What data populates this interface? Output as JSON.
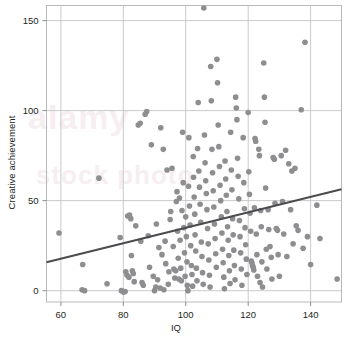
{
  "chart_data": {
    "type": "scatter",
    "title": "",
    "xlabel": "IQ",
    "ylabel": "Creative achievement",
    "xlim": [
      55.4,
      149.9
    ],
    "ylim": [
      -6.3,
      158.4
    ],
    "xticks": [
      60,
      80,
      100,
      120,
      140
    ],
    "yticks": [
      0,
      50,
      100,
      150
    ],
    "grid": true,
    "legend": null,
    "marker": {
      "shape": "circle",
      "color": "#8e8e91",
      "size": 5.6
    },
    "trendline": {
      "type": "linear",
      "color": "#4c4c4f",
      "width": 2.2,
      "x": [
        55.4,
        149.9
      ],
      "y": [
        15.8,
        56.3
      ]
    },
    "points": [
      [
        59.4,
        32.0
      ],
      [
        66.8,
        0.5
      ],
      [
        67.6,
        0.0
      ],
      [
        67.0,
        14.5
      ],
      [
        72.2,
        62.5
      ],
      [
        74.8,
        3.8
      ],
      [
        79.0,
        29.5
      ],
      [
        79.4,
        0.0
      ],
      [
        80.1,
        -0.8
      ],
      [
        80.6,
        -0.5
      ],
      [
        80.8,
        10.5
      ],
      [
        81.2,
        8.5
      ],
      [
        81.4,
        41.5
      ],
      [
        81.8,
        7.5
      ],
      [
        82.0,
        42.0
      ],
      [
        82.4,
        40.0
      ],
      [
        82.6,
        19.5
      ],
      [
        82.9,
        11.0
      ],
      [
        83.2,
        9.5
      ],
      [
        83.5,
        5.0
      ],
      [
        84.0,
        36.0
      ],
      [
        84.8,
        92.0
      ],
      [
        85.4,
        93.0
      ],
      [
        85.6,
        27.5
      ],
      [
        86.0,
        4.5
      ],
      [
        86.4,
        3.0
      ],
      [
        87.0,
        98.0
      ],
      [
        87.5,
        99.5
      ],
      [
        88.0,
        30.5
      ],
      [
        88.4,
        13.0
      ],
      [
        89.0,
        81.0
      ],
      [
        89.6,
        8.0
      ],
      [
        90.0,
        0.0
      ],
      [
        90.4,
        2.0
      ],
      [
        90.6,
        37.0
      ],
      [
        91.0,
        6.0
      ],
      [
        91.4,
        24.0
      ],
      [
        91.8,
        1.5
      ],
      [
        92.0,
        90.5
      ],
      [
        92.4,
        20.0
      ],
      [
        92.8,
        78.5
      ],
      [
        93.0,
        0.5
      ],
      [
        93.4,
        27.5
      ],
      [
        93.6,
        15.0
      ],
      [
        94.0,
        67.0
      ],
      [
        94.4,
        3.5
      ],
      [
        94.6,
        10.5
      ],
      [
        95.0,
        39.5
      ],
      [
        95.2,
        44.0
      ],
      [
        95.6,
        68.0
      ],
      [
        96.0,
        24.5
      ],
      [
        96.2,
        12.0
      ],
      [
        96.5,
        7.0
      ],
      [
        96.8,
        11.0
      ],
      [
        97.0,
        49.5
      ],
      [
        97.2,
        55.0
      ],
      [
        97.4,
        33.0
      ],
      [
        97.6,
        18.0
      ],
      [
        97.8,
        6.5
      ],
      [
        98.0,
        51.5
      ],
      [
        98.2,
        28.0
      ],
      [
        98.4,
        12.5
      ],
      [
        98.6,
        5.5
      ],
      [
        98.8,
        44.5
      ],
      [
        99.0,
        88.0
      ],
      [
        99.2,
        60.0
      ],
      [
        99.4,
        35.0
      ],
      [
        99.6,
        21.0
      ],
      [
        99.8,
        8.0
      ],
      [
        100.0,
        41.0
      ],
      [
        100.2,
        30.0
      ],
      [
        100.4,
        16.0
      ],
      [
        100.5,
        3.0
      ],
      [
        100.7,
        0.0
      ],
      [
        100.9,
        58.0
      ],
      [
        101.0,
        85.0
      ],
      [
        101.2,
        47.0
      ],
      [
        101.4,
        36.5
      ],
      [
        101.6,
        25.0
      ],
      [
        101.8,
        14.0
      ],
      [
        102.0,
        9.0
      ],
      [
        102.2,
        2.5
      ],
      [
        102.4,
        74.5
      ],
      [
        102.5,
        63.0
      ],
      [
        102.7,
        52.0
      ],
      [
        102.9,
        42.5
      ],
      [
        103.0,
        31.0
      ],
      [
        103.2,
        22.0
      ],
      [
        103.4,
        12.5
      ],
      [
        103.6,
        5.5
      ],
      [
        103.8,
        79.0
      ],
      [
        104.0,
        104.5
      ],
      [
        104.2,
        66.5
      ],
      [
        104.4,
        57.5
      ],
      [
        104.6,
        48.0
      ],
      [
        104.8,
        38.0
      ],
      [
        105.0,
        27.0
      ],
      [
        105.2,
        19.0
      ],
      [
        105.4,
        10.0
      ],
      [
        105.6,
        3.5
      ],
      [
        105.8,
        157.0
      ],
      [
        106.0,
        86.5
      ],
      [
        106.2,
        71.0
      ],
      [
        106.4,
        61.0
      ],
      [
        106.6,
        54.0
      ],
      [
        106.8,
        45.0
      ],
      [
        107.0,
        34.5
      ],
      [
        107.2,
        26.0
      ],
      [
        107.4,
        17.0
      ],
      [
        107.6,
        8.5
      ],
      [
        107.8,
        2.0
      ],
      [
        108.0,
        124.5
      ],
      [
        108.2,
        105.5
      ],
      [
        108.4,
        78.5
      ],
      [
        108.6,
        65.5
      ],
      [
        108.8,
        55.5
      ],
      [
        109.0,
        46.5
      ],
      [
        109.2,
        37.0
      ],
      [
        109.4,
        29.0
      ],
      [
        109.6,
        20.5
      ],
      [
        109.8,
        13.0
      ],
      [
        110.0,
        128.5
      ],
      [
        110.2,
        115.5
      ],
      [
        110.4,
        92.0
      ],
      [
        110.6,
        80.0
      ],
      [
        110.8,
        69.0
      ],
      [
        111.0,
        58.5
      ],
      [
        111.2,
        50.0
      ],
      [
        111.4,
        41.0
      ],
      [
        111.6,
        32.0
      ],
      [
        111.8,
        23.0
      ],
      [
        112.0,
        15.5
      ],
      [
        112.2,
        7.5
      ],
      [
        112.4,
        1.0
      ],
      [
        112.6,
        72.0
      ],
      [
        112.8,
        62.0
      ],
      [
        113.0,
        53.0
      ],
      [
        113.2,
        44.0
      ],
      [
        113.4,
        35.5
      ],
      [
        113.6,
        28.0
      ],
      [
        113.8,
        19.5
      ],
      [
        114.0,
        11.0
      ],
      [
        114.2,
        4.0
      ],
      [
        114.4,
        88.0
      ],
      [
        114.6,
        67.0
      ],
      [
        114.8,
        56.0
      ],
      [
        115.0,
        40.0
      ],
      [
        115.2,
        31.0
      ],
      [
        115.4,
        22.5
      ],
      [
        115.6,
        14.0
      ],
      [
        115.8,
        6.0
      ],
      [
        116.0,
        107.5
      ],
      [
        116.2,
        101.5
      ],
      [
        116.4,
        95.0
      ],
      [
        116.6,
        73.5
      ],
      [
        116.8,
        63.5
      ],
      [
        117.0,
        51.0
      ],
      [
        117.2,
        39.0
      ],
      [
        117.4,
        30.0
      ],
      [
        117.6,
        21.0
      ],
      [
        117.8,
        12.0
      ],
      [
        118.0,
        3.0
      ],
      [
        118.4,
        85.0
      ],
      [
        118.6,
        60.0
      ],
      [
        118.8,
        45.5
      ],
      [
        119.0,
        35.0
      ],
      [
        119.2,
        25.5
      ],
      [
        119.4,
        17.5
      ],
      [
        119.6,
        9.0
      ],
      [
        120.0,
        99.0
      ],
      [
        120.2,
        66.0
      ],
      [
        120.4,
        53.5
      ],
      [
        120.6,
        43.0
      ],
      [
        120.8,
        33.0
      ],
      [
        121.0,
        16.5
      ],
      [
        121.2,
        15.5
      ],
      [
        121.4,
        14.0
      ],
      [
        121.6,
        13.0
      ],
      [
        121.8,
        11.5
      ],
      [
        122.0,
        46.0
      ],
      [
        122.2,
        84.5
      ],
      [
        122.4,
        83.0
      ],
      [
        122.6,
        31.5
      ],
      [
        122.8,
        20.0
      ],
      [
        123.0,
        8.0
      ],
      [
        123.4,
        78.5
      ],
      [
        123.6,
        75.0
      ],
      [
        123.8,
        4.5
      ],
      [
        124.0,
        44.5
      ],
      [
        124.2,
        35.5
      ],
      [
        124.4,
        16.0
      ],
      [
        124.6,
        2.0
      ],
      [
        125.0,
        126.5
      ],
      [
        125.2,
        107.5
      ],
      [
        125.4,
        93.5
      ],
      [
        125.6,
        57.0
      ],
      [
        125.8,
        23.0
      ],
      [
        126.0,
        12.0
      ],
      [
        126.4,
        45.0
      ],
      [
        126.6,
        34.0
      ],
      [
        127.0,
        24.5
      ],
      [
        127.4,
        18.5
      ],
      [
        127.6,
        6.5
      ],
      [
        128.0,
        74.0
      ],
      [
        128.4,
        73.0
      ],
      [
        128.6,
        48.5
      ],
      [
        129.0,
        34.5
      ],
      [
        129.4,
        33.5
      ],
      [
        129.6,
        20.0
      ],
      [
        130.0,
        8.0
      ],
      [
        130.6,
        75.0
      ],
      [
        131.0,
        49.5
      ],
      [
        131.4,
        31.5
      ],
      [
        132.0,
        78.0
      ],
      [
        132.4,
        19.0
      ],
      [
        133.0,
        70.5
      ],
      [
        133.6,
        45.0
      ],
      [
        134.0,
        66.5
      ],
      [
        134.4,
        26.0
      ],
      [
        135.0,
        68.0
      ],
      [
        135.4,
        36.0
      ],
      [
        136.0,
        33.5
      ],
      [
        137.0,
        100.5
      ],
      [
        137.6,
        23.5
      ],
      [
        138.2,
        138.0
      ],
      [
        139.0,
        30.0
      ],
      [
        140.0,
        14.5
      ],
      [
        142.0,
        47.5
      ],
      [
        143.0,
        29.0
      ],
      [
        148.5,
        6.5
      ]
    ]
  },
  "watermark": {
    "line1": "alamy",
    "line2": "stock photo"
  }
}
